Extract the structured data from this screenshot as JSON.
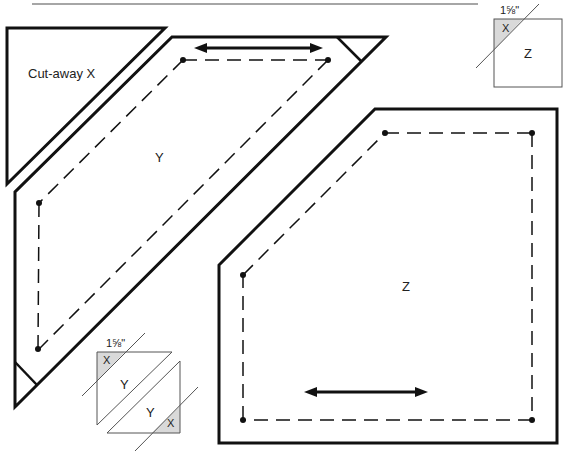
{
  "labels": {
    "cutaway": "Cut-away X",
    "piece_y": "Y",
    "piece_z": "Z"
  },
  "inset_z": {
    "measure": "1⅝\"",
    "label_x": "X",
    "label_z": "Z"
  },
  "inset_y": {
    "measure": "1⅝\"",
    "label_x_top": "X",
    "label_y_top": "Y",
    "label_y_bottom": "Y",
    "label_x_bottom": "X"
  },
  "colors": {
    "stroke": "#111111",
    "shade": "#d9d9d9",
    "rule": "#888888"
  }
}
